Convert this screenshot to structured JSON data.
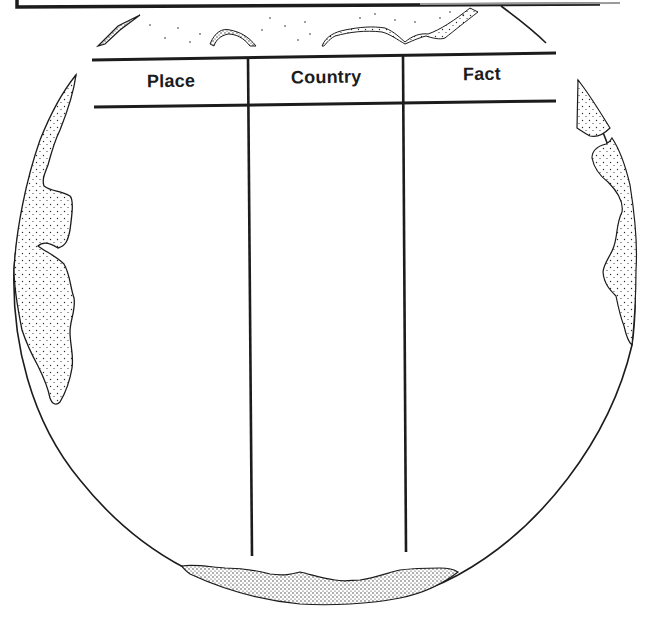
{
  "worksheet": {
    "table": {
      "columns": [
        {
          "label": "Place"
        },
        {
          "label": "Country"
        },
        {
          "label": "Fact"
        }
      ],
      "rows": []
    }
  },
  "colors": {
    "ink": "#1c1c1c",
    "paper": "#ffffff",
    "stipple": "#2a2a2a"
  }
}
